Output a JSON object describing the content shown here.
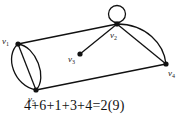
{
  "diagram": {
    "type": "multigraph",
    "vertices": [
      {
        "id": "v1",
        "label": "v",
        "sub": "1",
        "x": 18,
        "y": 44,
        "degree": 4
      },
      {
        "id": "v2",
        "label": "v",
        "sub": "2",
        "x": 117,
        "y": 24,
        "degree": 6
      },
      {
        "id": "v3",
        "label": "v",
        "sub": "3",
        "x": 80,
        "y": 54,
        "degree": 1
      },
      {
        "id": "v4",
        "label": "v",
        "sub": "4",
        "x": 166,
        "y": 64,
        "degree": 3
      },
      {
        "id": "v5",
        "label": "v",
        "sub": "5",
        "x": 36,
        "y": 90,
        "degree": 4
      }
    ],
    "edges": [
      {
        "from": "v1",
        "to": "v2",
        "kind": "straight"
      },
      {
        "from": "v1",
        "to": "v5",
        "kind": "straight"
      },
      {
        "from": "v1",
        "to": "v5",
        "kind": "curve-left"
      },
      {
        "from": "v1",
        "to": "v5",
        "kind": "curve-right"
      },
      {
        "from": "v2",
        "to": "v2",
        "kind": "loop"
      },
      {
        "from": "v2",
        "to": "v3",
        "kind": "straight"
      },
      {
        "from": "v2",
        "to": "v4",
        "kind": "straight"
      },
      {
        "from": "v2",
        "to": "v4",
        "kind": "curve"
      },
      {
        "from": "v5",
        "to": "v4",
        "kind": "straight"
      }
    ],
    "equation": "4+6+1+3+4=2(9)",
    "colors": {
      "stroke": "#111111",
      "background": "#ffffff"
    }
  }
}
